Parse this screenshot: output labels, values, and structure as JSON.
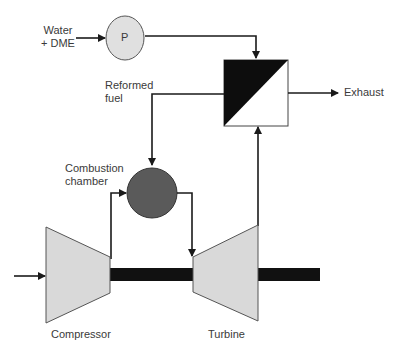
{
  "labels": {
    "feed_line1": "Water",
    "feed_line2": "+ DME",
    "pump": "P",
    "reformed_line1": "Reformed",
    "reformed_line2": "fuel",
    "exhaust": "Exhaust",
    "combustion_line1": "Combustion",
    "combustion_line2": "chamber",
    "compressor": "Compressor",
    "turbine": "Turbine"
  },
  "colors": {
    "line": "#1a1a1a",
    "machine_fill": "#d9d9d9",
    "pump_fill": "#e0e0e0",
    "combustion_fill": "#5a5a5a",
    "shaft": "#111111",
    "text": "#3a3a3a"
  }
}
